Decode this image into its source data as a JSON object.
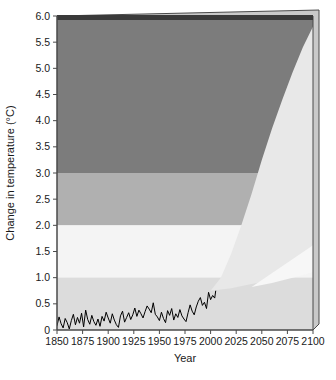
{
  "chart_data": {
    "type": "area",
    "title": "",
    "xlabel": "Year",
    "ylabel": "Change in temperature (°C)",
    "xlim": [
      1850,
      2100
    ],
    "ylim": [
      0,
      6.0
    ],
    "grid": false,
    "legend": "none",
    "x_ticks": [
      1850,
      1875,
      1900,
      1925,
      1950,
      1975,
      2000,
      2025,
      2050,
      2075,
      2100
    ],
    "x_tick_labels": [
      "1850",
      "1875",
      "1900",
      "1925",
      "1950",
      "1975",
      "2000",
      "2025",
      "2050",
      "2075",
      "2100"
    ],
    "y_ticks": [
      0,
      0.5,
      1.0,
      1.5,
      2.0,
      2.5,
      3.0,
      3.5,
      4.0,
      4.5,
      5.0,
      5.5,
      6.0
    ],
    "y_tick_labels": [
      "0",
      "0.5",
      "1.0",
      "1.5",
      "2.0",
      "2.5",
      "3.0",
      "3.5",
      "4.0",
      "4.5",
      "5.0",
      "5.5",
      "6.0"
    ],
    "bands": [
      {
        "name": "severe-risk-band",
        "y0": 3.0,
        "y1": 6.0,
        "color": "#7c7c7c"
      },
      {
        "name": "high-risk-band",
        "y0": 2.0,
        "y1": 3.0,
        "color": "#b0b0b0"
      },
      {
        "name": "moderate-risk-band",
        "y0": 1.0,
        "y1": 2.0,
        "color": "#f4f4f4"
      },
      {
        "name": "low-risk-band",
        "y0": 0.0,
        "y1": 1.0,
        "color": "#dcdcdc"
      }
    ],
    "projection_cone": {
      "name": "projection-uncertainty-cone",
      "color": "#e8e8e8",
      "start_year": 2000,
      "end_year": 2100,
      "upper_bound_end": 5.8,
      "lower_bound_end": 1.1,
      "upper_bound": [
        {
          "x": 2000,
          "y": 0.75
        },
        {
          "x": 2010,
          "y": 1.0
        },
        {
          "x": 2020,
          "y": 1.45
        },
        {
          "x": 2030,
          "y": 2.0
        },
        {
          "x": 2040,
          "y": 2.6
        },
        {
          "x": 2050,
          "y": 3.25
        },
        {
          "x": 2060,
          "y": 3.85
        },
        {
          "x": 2070,
          "y": 4.4
        },
        {
          "x": 2080,
          "y": 4.92
        },
        {
          "x": 2090,
          "y": 5.4
        },
        {
          "x": 2100,
          "y": 5.8
        }
      ],
      "lower_bound": [
        {
          "x": 2000,
          "y": 0.75
        },
        {
          "x": 2020,
          "y": 0.8
        },
        {
          "x": 2040,
          "y": 0.88
        },
        {
          "x": 2060,
          "y": 0.95
        },
        {
          "x": 2080,
          "y": 1.02
        },
        {
          "x": 2100,
          "y": 1.1
        }
      ]
    },
    "projection_inner_wedge": {
      "name": "projection-lower-range-wedge",
      "color": "#f7f7f7",
      "points": [
        {
          "x": 2040,
          "y": 0.82
        },
        {
          "x": 2100,
          "y": 1.62
        },
        {
          "x": 2100,
          "y": 1.1
        },
        {
          "x": 2060,
          "y": 0.9
        }
      ]
    },
    "series": [
      {
        "name": "observed-temperature-record",
        "label": "Observed temperature",
        "color": "#000000",
        "x": [
          1850,
          1852,
          1854,
          1856,
          1858,
          1860,
          1862,
          1864,
          1866,
          1868,
          1870,
          1872,
          1874,
          1876,
          1878,
          1880,
          1882,
          1884,
          1886,
          1888,
          1890,
          1892,
          1894,
          1896,
          1898,
          1900,
          1902,
          1904,
          1906,
          1908,
          1910,
          1912,
          1914,
          1916,
          1918,
          1920,
          1922,
          1924,
          1926,
          1928,
          1930,
          1932,
          1934,
          1936,
          1938,
          1940,
          1942,
          1944,
          1946,
          1948,
          1950,
          1952,
          1954,
          1956,
          1958,
          1960,
          1962,
          1964,
          1966,
          1968,
          1970,
          1972,
          1974,
          1976,
          1978,
          1980,
          1982,
          1984,
          1986,
          1988,
          1990,
          1992,
          1994,
          1996,
          1998,
          2000,
          2002,
          2004,
          2005
        ],
        "values": [
          0.08,
          0.25,
          0.12,
          0.04,
          0.22,
          0.14,
          0.02,
          0.18,
          0.3,
          0.1,
          0.24,
          0.13,
          0.32,
          0.06,
          0.38,
          0.2,
          0.11,
          0.28,
          0.16,
          0.09,
          0.21,
          0.07,
          0.26,
          0.17,
          0.34,
          0.23,
          0.13,
          0.31,
          0.19,
          0.1,
          0.05,
          0.27,
          0.36,
          0.15,
          0.24,
          0.33,
          0.2,
          0.29,
          0.42,
          0.26,
          0.38,
          0.31,
          0.23,
          0.35,
          0.46,
          0.4,
          0.33,
          0.52,
          0.3,
          0.25,
          0.18,
          0.34,
          0.22,
          0.14,
          0.37,
          0.28,
          0.41,
          0.19,
          0.31,
          0.24,
          0.39,
          0.27,
          0.21,
          0.16,
          0.33,
          0.48,
          0.36,
          0.29,
          0.44,
          0.55,
          0.62,
          0.47,
          0.53,
          0.41,
          0.72,
          0.58,
          0.66,
          0.61,
          0.75
        ]
      }
    ]
  },
  "layout": {
    "plot_left": 57,
    "plot_right": 313,
    "plot_top": 16,
    "plot_bottom": 330
  }
}
